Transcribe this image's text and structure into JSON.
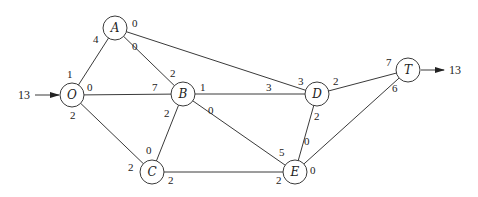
{
  "diagram": {
    "type": "network flow graph",
    "supply": {
      "node": "O",
      "value": "13"
    },
    "demand": {
      "node": "T",
      "value": "13"
    },
    "nodes": [
      {
        "id": "O",
        "label": "O",
        "x": 72,
        "y": 95
      },
      {
        "id": "A",
        "label": "A",
        "x": 115,
        "y": 28
      },
      {
        "id": "B",
        "label": "B",
        "x": 183,
        "y": 94
      },
      {
        "id": "C",
        "label": "C",
        "x": 152,
        "y": 172
      },
      {
        "id": "D",
        "label": "D",
        "x": 317,
        "y": 94
      },
      {
        "id": "E",
        "label": "E",
        "x": 295,
        "y": 172
      },
      {
        "id": "T",
        "label": "T",
        "x": 408,
        "y": 70
      }
    ],
    "edges": [
      {
        "from": "O",
        "to": "A",
        "from_label": "1",
        "to_label": "4"
      },
      {
        "from": "O",
        "to": "B",
        "from_label": "0",
        "to_label": "7"
      },
      {
        "from": "O",
        "to": "C",
        "from_label": "2",
        "to_label": "2"
      },
      {
        "from": "A",
        "to": "B",
        "from_label": "0",
        "to_label": "2"
      },
      {
        "from": "A",
        "to": "D",
        "from_label": "0",
        "to_label": "3"
      },
      {
        "from": "B",
        "to": "C",
        "from_label": "2",
        "to_label": "0"
      },
      {
        "from": "B",
        "to": "D",
        "from_label": "1",
        "to_label": "3"
      },
      {
        "from": "B",
        "to": "E",
        "from_label": "0",
        "to_label": "5"
      },
      {
        "from": "C",
        "to": "E",
        "from_label": "2",
        "to_label": "2"
      },
      {
        "from": "D",
        "to": "E",
        "from_label": "2",
        "to_label": "0"
      },
      {
        "from": "D",
        "to": "T",
        "from_label": "2",
        "to_label": "7"
      },
      {
        "from": "E",
        "to": "T",
        "from_label": "0",
        "to_label": "6"
      }
    ]
  }
}
